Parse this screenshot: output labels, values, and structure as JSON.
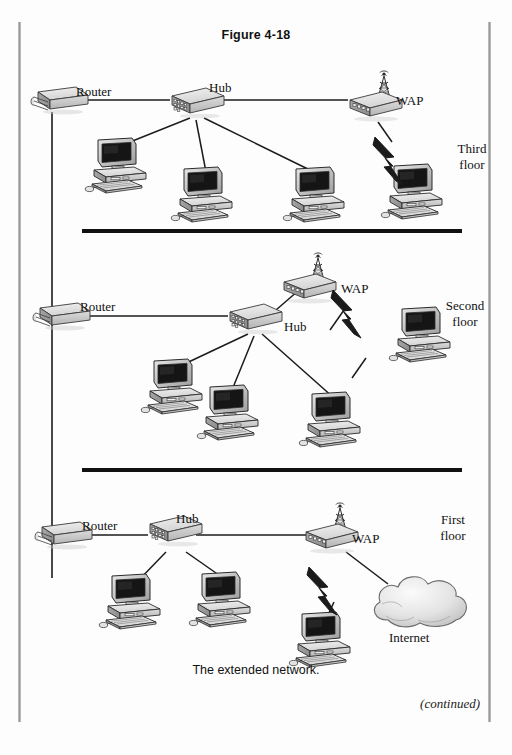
{
  "page": {
    "figure_title": "Figure 4-18",
    "caption": "The extended network.",
    "continued_note": "(continued)"
  },
  "labels": {
    "router": "Router",
    "hub": "Hub",
    "wap": "WAP",
    "internet": "Internet",
    "third_floor_a": "Third",
    "third_floor_b": "floor",
    "second_floor_a": "Second",
    "second_floor_b": "floor",
    "first_floor_a": "First",
    "first_floor_b": "floor"
  },
  "colors": {
    "ink": "#111111",
    "paper": "#fdfdfd",
    "device_fill": "#d8d8d8",
    "device_top": "#ececec",
    "device_side": "#a8a8a8",
    "screen": "#1d1d1d",
    "gutter": "#9a9a9a"
  },
  "floors": [
    {
      "name": "Third floor",
      "label_line1": "Third",
      "label_line2": "floor",
      "devices": {
        "router": "Router",
        "hub": "Hub",
        "wap": "WAP",
        "workstations": 3,
        "wireless_workstations": 1
      }
    },
    {
      "name": "Second floor",
      "label_line1": "Second",
      "label_line2": "floor",
      "devices": {
        "router": "Router",
        "hub": "Hub",
        "wap": "WAP",
        "workstations": 3,
        "wireless_workstations": 1
      }
    },
    {
      "name": "First floor",
      "label_line1": "First",
      "label_line2": "floor",
      "devices": {
        "router": "Router",
        "hub": "Hub",
        "wap": "WAP",
        "workstations": 2,
        "wireless_workstations": 1,
        "cloud": "Internet"
      }
    }
  ],
  "icons": {
    "router": "router-icon",
    "hub": "hub-icon",
    "wap": "wireless-access-point-icon",
    "workstation": "desktop-computer-icon",
    "cloud": "internet-cloud-icon",
    "wireless": "lightning-bolt-icon",
    "antenna": "antenna-icon"
  }
}
